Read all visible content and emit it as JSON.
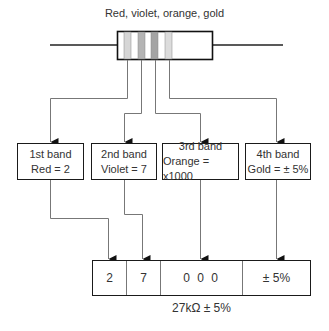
{
  "title": "Red, violet, orange, gold",
  "resistor": {
    "bands": [
      {
        "name": "red",
        "shade": "#d6d6d6"
      },
      {
        "name": "violet",
        "shade": "#b4b4b4"
      },
      {
        "name": "orange",
        "shade": "#a4a4a4"
      },
      {
        "name": "gold",
        "shade": "#dcdcdc"
      }
    ]
  },
  "band_boxes": [
    {
      "heading": "1st band",
      "value": "Red = 2"
    },
    {
      "heading": "2nd band",
      "value": "Violet = 7"
    },
    {
      "heading": "3rd band",
      "value": "Orange = x1000"
    },
    {
      "heading": "4th band",
      "value": "Gold = ± 5%"
    }
  ],
  "result": {
    "cells": [
      "2",
      "7",
      "0 0 0",
      "± 5%"
    ]
  },
  "caption": "27kΩ ± 5%"
}
